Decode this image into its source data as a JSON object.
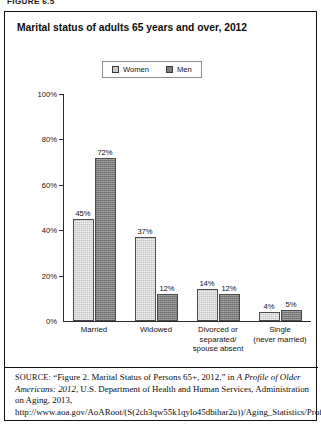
{
  "figure_label": "FIGURE 6.5",
  "chart": {
    "title": "Marital status of adults 65 years and over, 2012"
  },
  "legend": {
    "items": [
      {
        "label": "Women",
        "color": "#c2c2c2",
        "icon": "legend-swatch-icon"
      },
      {
        "label": "Men",
        "color": "#7c7c7c",
        "icon": "legend-swatch-icon"
      }
    ]
  },
  "source": {
    "lead": "SOURCE:",
    "line1_pre": " “Figure 2. Marital Status of Persons 65+, 2012,” in ",
    "title_italic": "A Profile of Older Americans: 2012",
    "line2_post": ", U.S. Department of Health and Human Services, Administration on Aging, 2013, http://www.aoa.gov/AoARoot/(S(2ch3qw55k1qylo45dbihar2u))/Aging_Statistics/Profile/"
  },
  "chart_data": {
    "type": "bar",
    "title": "Marital status of adults 65 years and over, 2012",
    "xlabel": "",
    "ylabel": "",
    "ylim": [
      0,
      100
    ],
    "yticks": [
      "0%",
      "20%",
      "40%",
      "60%",
      "80%",
      "100%"
    ],
    "ytick_values": [
      0,
      20,
      40,
      60,
      80,
      100
    ],
    "grid": false,
    "legend_position": "top-center",
    "categories": [
      "Married",
      "Widowed",
      "Divorced or separated/ spouse absent",
      "Single (never married)"
    ],
    "category_lines": [
      [
        "Married"
      ],
      [
        "Widowed"
      ],
      [
        "Divorced or",
        "separated/",
        "spouse absent"
      ],
      [
        "Single",
        "(never married)"
      ]
    ],
    "series": [
      {
        "name": "Women",
        "values": [
          45,
          37,
          14,
          4
        ],
        "labels": [
          "45%",
          "37%",
          "14%",
          "4%"
        ]
      },
      {
        "name": "Men",
        "values": [
          72,
          12,
          12,
          5
        ],
        "labels": [
          "72%",
          "12%",
          "12%",
          "5%"
        ]
      }
    ]
  }
}
